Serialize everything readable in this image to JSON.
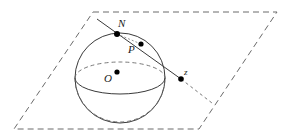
{
  "figure": {
    "name": "stereographic-projection-diagram",
    "labels": {
      "north_pole": "N",
      "sphere_point": "P",
      "sphere_center": "O",
      "plane_point": "z"
    },
    "colors": {
      "stroke": "#3a3a3a",
      "dashed": "#6a6a6a",
      "point_fill": "#000000",
      "background": "#ffffff",
      "text": "#1a1a1a"
    },
    "geometry": {
      "plane_parallelogram": "93,12 277,12 199,129 14,129",
      "sphere_center_xy": [
        120,
        78
      ],
      "sphere_radius": 45,
      "equator_rx": 45,
      "equator_ry": 16,
      "north_pole_xy": [
        117,
        34
      ],
      "sphere_point_xy": [
        141,
        44
      ],
      "plane_point_xy": [
        181,
        79
      ],
      "ray_start_xy": [
        97,
        19
      ],
      "ray_end_xy": [
        212,
        103
      ]
    }
  }
}
